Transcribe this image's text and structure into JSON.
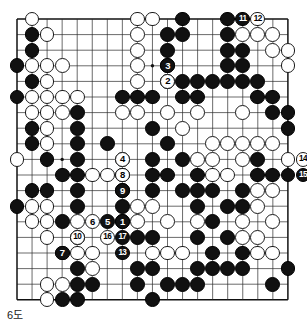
{
  "caption": {
    "text": "6도"
  },
  "board": {
    "size": 19,
    "origin_x": 17,
    "origin_y": 19,
    "step_x": 15.05,
    "step_y": 15.6,
    "stone_radius": 7.4,
    "line_color": "#2b2b2b",
    "border_color": "#111111",
    "black_color": "#111111",
    "white_color": "#ffffff",
    "background": "#ffffff",
    "star_points": [
      [
        3,
        3
      ],
      [
        9,
        3
      ],
      [
        15,
        3
      ],
      [
        3,
        9
      ],
      [
        9,
        9
      ],
      [
        15,
        9
      ],
      [
        3,
        15
      ],
      [
        9,
        15
      ],
      [
        15,
        15
      ]
    ]
  },
  "stones": [
    {
      "c": 1,
      "r": 0,
      "color": "white"
    },
    {
      "c": 8,
      "r": 0,
      "color": "white"
    },
    {
      "c": 9,
      "r": 0,
      "color": "white"
    },
    {
      "c": 11,
      "r": 0,
      "color": "black"
    },
    {
      "c": 14,
      "r": 0,
      "color": "black"
    },
    {
      "c": 1,
      "r": 1,
      "color": "black"
    },
    {
      "c": 2,
      "r": 1,
      "color": "white"
    },
    {
      "c": 8,
      "r": 1,
      "color": "white"
    },
    {
      "c": 10,
      "r": 1,
      "color": "black"
    },
    {
      "c": 11,
      "r": 1,
      "color": "black"
    },
    {
      "c": 14,
      "r": 1,
      "color": "black"
    },
    {
      "c": 15,
      "r": 1,
      "color": "white"
    },
    {
      "c": 16,
      "r": 1,
      "color": "white"
    },
    {
      "c": 17,
      "r": 1,
      "color": "white"
    },
    {
      "c": 1,
      "r": 2,
      "color": "black"
    },
    {
      "c": 8,
      "r": 2,
      "color": "white"
    },
    {
      "c": 10,
      "r": 2,
      "color": "black"
    },
    {
      "c": 14,
      "r": 2,
      "color": "black"
    },
    {
      "c": 15,
      "r": 2,
      "color": "black"
    },
    {
      "c": 17,
      "r": 2,
      "color": "white"
    },
    {
      "c": 18,
      "r": 2,
      "color": "white"
    },
    {
      "c": 0,
      "r": 3,
      "color": "black"
    },
    {
      "c": 1,
      "r": 3,
      "color": "white"
    },
    {
      "c": 2,
      "r": 3,
      "color": "white"
    },
    {
      "c": 3,
      "r": 3,
      "color": "white"
    },
    {
      "c": 8,
      "r": 3,
      "color": "white"
    },
    {
      "c": 10,
      "r": 3,
      "color": "black"
    },
    {
      "c": 14,
      "r": 3,
      "color": "black"
    },
    {
      "c": 15,
      "r": 3,
      "color": "black"
    },
    {
      "c": 18,
      "r": 3,
      "color": "white"
    },
    {
      "c": 1,
      "r": 4,
      "color": "black"
    },
    {
      "c": 2,
      "r": 4,
      "color": "white"
    },
    {
      "c": 8,
      "r": 4,
      "color": "white"
    },
    {
      "c": 10,
      "r": 4,
      "color": "black"
    },
    {
      "c": 11,
      "r": 4,
      "color": "black"
    },
    {
      "c": 12,
      "r": 4,
      "color": "black"
    },
    {
      "c": 13,
      "r": 4,
      "color": "black"
    },
    {
      "c": 14,
      "r": 4,
      "color": "black"
    },
    {
      "c": 15,
      "r": 4,
      "color": "black"
    },
    {
      "c": 16,
      "r": 4,
      "color": "black"
    },
    {
      "c": 0,
      "r": 5,
      "color": "black"
    },
    {
      "c": 1,
      "r": 5,
      "color": "white"
    },
    {
      "c": 2,
      "r": 5,
      "color": "white"
    },
    {
      "c": 3,
      "r": 5,
      "color": "white"
    },
    {
      "c": 4,
      "r": 5,
      "color": "white"
    },
    {
      "c": 7,
      "r": 5,
      "color": "black"
    },
    {
      "c": 8,
      "r": 5,
      "color": "black"
    },
    {
      "c": 9,
      "r": 5,
      "color": "black"
    },
    {
      "c": 11,
      "r": 5,
      "color": "black"
    },
    {
      "c": 12,
      "r": 5,
      "color": "black"
    },
    {
      "c": 16,
      "r": 5,
      "color": "black"
    },
    {
      "c": 17,
      "r": 5,
      "color": "black"
    },
    {
      "c": 1,
      "r": 6,
      "color": "white"
    },
    {
      "c": 2,
      "r": 6,
      "color": "white"
    },
    {
      "c": 3,
      "r": 6,
      "color": "white"
    },
    {
      "c": 4,
      "r": 6,
      "color": "black"
    },
    {
      "c": 7,
      "r": 6,
      "color": "white"
    },
    {
      "c": 8,
      "r": 6,
      "color": "white"
    },
    {
      "c": 10,
      "r": 6,
      "color": "white"
    },
    {
      "c": 12,
      "r": 6,
      "color": "white"
    },
    {
      "c": 15,
      "r": 6,
      "color": "white"
    },
    {
      "c": 17,
      "r": 6,
      "color": "black"
    },
    {
      "c": 18,
      "r": 6,
      "color": "black"
    },
    {
      "c": 1,
      "r": 7,
      "color": "black"
    },
    {
      "c": 2,
      "r": 7,
      "color": "white"
    },
    {
      "c": 4,
      "r": 7,
      "color": "black"
    },
    {
      "c": 9,
      "r": 7,
      "color": "black"
    },
    {
      "c": 11,
      "r": 7,
      "color": "white"
    },
    {
      "c": 18,
      "r": 7,
      "color": "black"
    },
    {
      "c": 1,
      "r": 8,
      "color": "black"
    },
    {
      "c": 2,
      "r": 8,
      "color": "white"
    },
    {
      "c": 4,
      "r": 8,
      "color": "black"
    },
    {
      "c": 6,
      "r": 8,
      "color": "black"
    },
    {
      "c": 10,
      "r": 8,
      "color": "black"
    },
    {
      "c": 13,
      "r": 8,
      "color": "white"
    },
    {
      "c": 14,
      "r": 8,
      "color": "white"
    },
    {
      "c": 15,
      "r": 8,
      "color": "white"
    },
    {
      "c": 16,
      "r": 8,
      "color": "white"
    },
    {
      "c": 17,
      "r": 8,
      "color": "white"
    },
    {
      "c": 0,
      "r": 9,
      "color": "white"
    },
    {
      "c": 2,
      "r": 9,
      "color": "black"
    },
    {
      "c": 4,
      "r": 9,
      "color": "black"
    },
    {
      "c": 7,
      "r": 9,
      "color": "white"
    },
    {
      "c": 9,
      "r": 9,
      "color": "black"
    },
    {
      "c": 11,
      "r": 9,
      "color": "black"
    },
    {
      "c": 12,
      "r": 9,
      "color": "white"
    },
    {
      "c": 13,
      "r": 9,
      "color": "white"
    },
    {
      "c": 15,
      "r": 9,
      "color": "white"
    },
    {
      "c": 16,
      "r": 9,
      "color": "black"
    },
    {
      "c": 18,
      "r": 9,
      "color": "white"
    },
    {
      "c": 3,
      "r": 10,
      "color": "black"
    },
    {
      "c": 4,
      "r": 10,
      "color": "black"
    },
    {
      "c": 5,
      "r": 10,
      "color": "white"
    },
    {
      "c": 6,
      "r": 10,
      "color": "white"
    },
    {
      "c": 7,
      "r": 10,
      "color": "black"
    },
    {
      "c": 9,
      "r": 10,
      "color": "black"
    },
    {
      "c": 10,
      "r": 10,
      "color": "black"
    },
    {
      "c": 12,
      "r": 10,
      "color": "black"
    },
    {
      "c": 13,
      "r": 10,
      "color": "white"
    },
    {
      "c": 14,
      "r": 10,
      "color": "white"
    },
    {
      "c": 16,
      "r": 10,
      "color": "black"
    },
    {
      "c": 17,
      "r": 10,
      "color": "black"
    },
    {
      "c": 18,
      "r": 10,
      "color": "black"
    },
    {
      "c": 1,
      "r": 11,
      "color": "black"
    },
    {
      "c": 2,
      "r": 11,
      "color": "black"
    },
    {
      "c": 4,
      "r": 11,
      "color": "black"
    },
    {
      "c": 7,
      "r": 11,
      "color": "black"
    },
    {
      "c": 9,
      "r": 11,
      "color": "black"
    },
    {
      "c": 11,
      "r": 11,
      "color": "black"
    },
    {
      "c": 12,
      "r": 11,
      "color": "black"
    },
    {
      "c": 13,
      "r": 11,
      "color": "black"
    },
    {
      "c": 15,
      "r": 11,
      "color": "black"
    },
    {
      "c": 16,
      "r": 11,
      "color": "white"
    },
    {
      "c": 17,
      "r": 11,
      "color": "white"
    },
    {
      "c": 0,
      "r": 12,
      "color": "black"
    },
    {
      "c": 1,
      "r": 12,
      "color": "white"
    },
    {
      "c": 2,
      "r": 12,
      "color": "white"
    },
    {
      "c": 4,
      "r": 12,
      "color": "black"
    },
    {
      "c": 7,
      "r": 12,
      "color": "black"
    },
    {
      "c": 8,
      "r": 12,
      "color": "white"
    },
    {
      "c": 9,
      "r": 12,
      "color": "white"
    },
    {
      "c": 12,
      "r": 12,
      "color": "black"
    },
    {
      "c": 14,
      "r": 12,
      "color": "black"
    },
    {
      "c": 15,
      "r": 12,
      "color": "black"
    },
    {
      "c": 16,
      "r": 12,
      "color": "white"
    },
    {
      "c": 1,
      "r": 13,
      "color": "white"
    },
    {
      "c": 2,
      "r": 13,
      "color": "white"
    },
    {
      "c": 3,
      "r": 13,
      "color": "black"
    },
    {
      "c": 4,
      "r": 13,
      "color": "white"
    },
    {
      "c": 7,
      "r": 13,
      "color": "black"
    },
    {
      "c": 8,
      "r": 13,
      "color": "white"
    },
    {
      "c": 10,
      "r": 13,
      "color": "white"
    },
    {
      "c": 12,
      "r": 13,
      "color": "white"
    },
    {
      "c": 13,
      "r": 13,
      "color": "black"
    },
    {
      "c": 15,
      "r": 13,
      "color": "white"
    },
    {
      "c": 17,
      "r": 13,
      "color": "white"
    },
    {
      "c": 2,
      "r": 14,
      "color": "white"
    },
    {
      "c": 4,
      "r": 14,
      "color": "black"
    },
    {
      "c": 8,
      "r": 14,
      "color": "black"
    },
    {
      "c": 9,
      "r": 14,
      "color": "black"
    },
    {
      "c": 12,
      "r": 14,
      "color": "black"
    },
    {
      "c": 14,
      "r": 14,
      "color": "black"
    },
    {
      "c": 15,
      "r": 14,
      "color": "white"
    },
    {
      "c": 16,
      "r": 14,
      "color": "white"
    },
    {
      "c": 3,
      "r": 15,
      "color": "white"
    },
    {
      "c": 4,
      "r": 15,
      "color": "white"
    },
    {
      "c": 5,
      "r": 15,
      "color": "white"
    },
    {
      "c": 9,
      "r": 15,
      "color": "white"
    },
    {
      "c": 10,
      "r": 15,
      "color": "white"
    },
    {
      "c": 11,
      "r": 15,
      "color": "white"
    },
    {
      "c": 13,
      "r": 15,
      "color": "black"
    },
    {
      "c": 15,
      "r": 15,
      "color": "black"
    },
    {
      "c": 16,
      "r": 15,
      "color": "white"
    },
    {
      "c": 17,
      "r": 15,
      "color": "white"
    },
    {
      "c": 4,
      "r": 16,
      "color": "black"
    },
    {
      "c": 5,
      "r": 16,
      "color": "white"
    },
    {
      "c": 8,
      "r": 16,
      "color": "black"
    },
    {
      "c": 9,
      "r": 16,
      "color": "black"
    },
    {
      "c": 12,
      "r": 16,
      "color": "black"
    },
    {
      "c": 13,
      "r": 16,
      "color": "black"
    },
    {
      "c": 14,
      "r": 16,
      "color": "black"
    },
    {
      "c": 15,
      "r": 16,
      "color": "black"
    },
    {
      "c": 18,
      "r": 16,
      "color": "black"
    },
    {
      "c": 2,
      "r": 17,
      "color": "white"
    },
    {
      "c": 3,
      "r": 17,
      "color": "white"
    },
    {
      "c": 4,
      "r": 17,
      "color": "black"
    },
    {
      "c": 5,
      "r": 17,
      "color": "black"
    },
    {
      "c": 8,
      "r": 17,
      "color": "black"
    },
    {
      "c": 10,
      "r": 17,
      "color": "black"
    },
    {
      "c": 11,
      "r": 17,
      "color": "black"
    },
    {
      "c": 12,
      "r": 17,
      "color": "black"
    },
    {
      "c": 17,
      "r": 17,
      "color": "black"
    },
    {
      "c": 2,
      "r": 18,
      "color": "white"
    },
    {
      "c": 3,
      "r": 18,
      "color": "black"
    },
    {
      "c": 4,
      "r": 18,
      "color": "black"
    },
    {
      "c": 9,
      "r": 18,
      "color": "black"
    }
  ],
  "moves": [
    {
      "n": "1",
      "c": 7,
      "r": 13,
      "color": "black"
    },
    {
      "n": "2",
      "c": 10,
      "r": 4,
      "color": "white",
      "off": true
    },
    {
      "n": "3",
      "c": 10,
      "r": 3,
      "color": "black",
      "off": true
    },
    {
      "n": "4",
      "c": 7,
      "r": 9,
      "color": "white"
    },
    {
      "n": "5",
      "c": 6,
      "r": 13,
      "color": "black"
    },
    {
      "n": "6",
      "c": 5,
      "r": 13,
      "color": "white"
    },
    {
      "n": "7",
      "c": 3,
      "r": 15,
      "color": "black"
    },
    {
      "n": "8",
      "c": 7,
      "r": 10,
      "color": "white"
    },
    {
      "n": "9",
      "c": 7,
      "r": 11,
      "color": "black"
    },
    {
      "n": "10",
      "c": 4,
      "r": 14,
      "color": "white"
    },
    {
      "n": "11",
      "c": 15,
      "r": 0,
      "color": "black"
    },
    {
      "n": "12",
      "c": 16,
      "r": 0,
      "color": "white",
      "outside": "right-top"
    },
    {
      "n": "13",
      "c": 7,
      "r": 15,
      "color": "black"
    },
    {
      "n": "14",
      "c": 19,
      "r": 9,
      "color": "white",
      "outside": "right"
    },
    {
      "n": "15",
      "c": 19,
      "r": 10,
      "color": "black",
      "outside": "right"
    },
    {
      "n": "16",
      "c": 6,
      "r": 14,
      "color": "white"
    },
    {
      "n": "17",
      "c": 7,
      "r": 14,
      "color": "black"
    }
  ]
}
